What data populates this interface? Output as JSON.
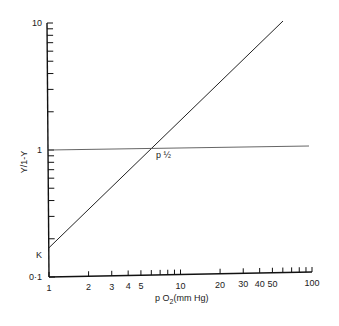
{
  "chart_data": {
    "type": "line",
    "title": "",
    "xlabel": "p O2 (mm Hg)",
    "ylabel": "Y/1-Y",
    "xscale": "log",
    "yscale": "log",
    "xlim": [
      1,
      100
    ],
    "ylim": [
      0.1,
      10
    ],
    "grid": false,
    "x_ticks": [
      1,
      2,
      3,
      4,
      5,
      6,
      7,
      8,
      9,
      10,
      20,
      30,
      40,
      50,
      60,
      70,
      80,
      90,
      100
    ],
    "x_tick_labels": [
      {
        "value": 1,
        "label": "1"
      },
      {
        "value": 2,
        "label": "2"
      },
      {
        "value": 3,
        "label": "3"
      },
      {
        "value": 4,
        "label": "4"
      },
      {
        "value": 5,
        "label": "5"
      },
      {
        "value": 10,
        "label": "10"
      },
      {
        "value": 20,
        "label": "20"
      },
      {
        "value": 30,
        "label": "30"
      },
      {
        "value": 40,
        "label": "40"
      },
      {
        "value": 50,
        "label": "50"
      },
      {
        "value": 100,
        "label": "100"
      }
    ],
    "y_ticks": [
      0.1,
      0.2,
      0.3,
      0.4,
      0.5,
      0.6,
      0.7,
      0.8,
      0.9,
      1,
      2,
      3,
      4,
      5,
      6,
      7,
      8,
      9,
      10
    ],
    "y_tick_labels": [
      {
        "value": 0.1,
        "label": "0·1"
      },
      {
        "value": 1,
        "label": "1"
      },
      {
        "value": 10,
        "label": "10"
      }
    ],
    "series": [
      {
        "name": "Hill plot (slope 1)",
        "x": [
          1,
          60
        ],
        "y": [
          0.17,
          10
        ]
      },
      {
        "name": "Y/1-Y = 1",
        "x": [
          1,
          100
        ],
        "y": [
          1,
          1.05
        ]
      }
    ],
    "annotations": [
      {
        "text": "K",
        "x": 1,
        "y": 0.17
      },
      {
        "text": "p ½",
        "x": 6,
        "y": 1
      }
    ]
  },
  "labels": {
    "y_axis_title": "Y/1-Y",
    "x_axis_title_prefix": "p O",
    "x_axis_title_sub": "2",
    "x_axis_title_suffix": "(mm Hg)",
    "k_label": "K",
    "p_half_label": "p ½"
  }
}
